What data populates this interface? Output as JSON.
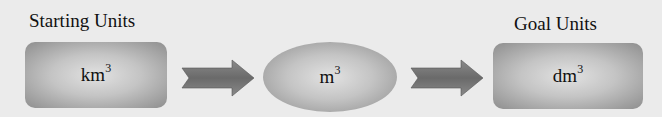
{
  "diagram": {
    "start": {
      "label": "Starting Units",
      "unit": "km",
      "exponent": "3"
    },
    "middle": {
      "unit": "m",
      "exponent": "3"
    },
    "goal": {
      "label": "Goal Units",
      "unit": "dm",
      "exponent": "3"
    },
    "colors": {
      "background": "#ebebeb",
      "shape_dark": "#8e8e8e",
      "shape_light": "#e2e2e2",
      "arrow": "#6f6f6f"
    }
  }
}
